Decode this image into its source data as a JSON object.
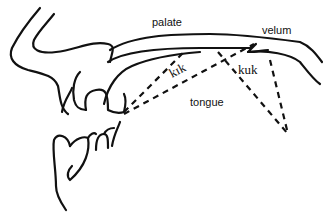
{
  "diagram": {
    "type": "midsagittal vocal tract diagram",
    "labels": {
      "palate": "palate",
      "velum": "velum",
      "tongue": "tongue",
      "front_consonant": "kɪk",
      "back_consonant": "kuk"
    },
    "colors": {
      "line": "#111111",
      "background": "#ffffff"
    }
  }
}
